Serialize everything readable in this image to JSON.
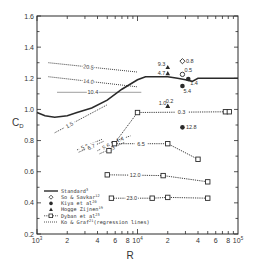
{
  "chart_data": {
    "type": "line",
    "title": "",
    "xlabel": "R",
    "ylabel": "C",
    "ylabel_subscript": "D",
    "xscale": "log",
    "xlim": [
      1000,
      100000
    ],
    "ylim": [
      0.2,
      1.6
    ],
    "y_ticks": [
      0.2,
      0.4,
      0.6,
      0.8,
      1.0,
      1.2,
      1.4,
      1.6
    ],
    "y_tick_labels": [
      "0.2",
      "0.4",
      "0.6",
      "0.8",
      "1.0",
      "1.2",
      "1.4",
      "1.6"
    ],
    "x_major_ticks": [
      1000,
      10000,
      100000
    ],
    "x_tick_labels": [
      {
        "value": 1000,
        "base": "10",
        "exp": "3"
      },
      {
        "value": 2000,
        "base": "2",
        "exp": ""
      },
      {
        "value": 4000,
        "base": "4",
        "exp": ""
      },
      {
        "value": 6000,
        "base": "6",
        "exp": ""
      },
      {
        "value": 8000,
        "base": "8",
        "exp": ""
      },
      {
        "value": 10000,
        "base": "10",
        "exp": "4"
      },
      {
        "value": 20000,
        "base": "2",
        "exp": ""
      },
      {
        "value": 40000,
        "base": "4",
        "exp": ""
      },
      {
        "value": 60000,
        "base": "6",
        "exp": ""
      },
      {
        "value": 80000,
        "base": "8",
        "exp": ""
      },
      {
        "value": 100000,
        "base": "10",
        "exp": "5"
      }
    ],
    "grid": false,
    "legend_position": "bottom-left",
    "legend": [
      {
        "key": "standard",
        "label": "Standard",
        "ref": "3"
      },
      {
        "key": "so_savkar",
        "label": "So & Savkar",
        "ref": "12"
      },
      {
        "key": "kiya",
        "label": "Kiya et al",
        "ref": "20"
      },
      {
        "key": "hogge",
        "label": "Hogge Zijnen",
        "ref": "19"
      },
      {
        "key": "dyban",
        "label": "Dyban et al",
        "ref": "23"
      },
      {
        "key": "ko_graf",
        "label": "Ko & Graf",
        "ref": "21",
        "suffix": "(regression lines)"
      }
    ],
    "series": [
      {
        "name": "Standard",
        "style": "solid",
        "x": [
          1000,
          1200,
          1500,
          2000,
          2500,
          3500,
          5000,
          7000,
          10000,
          12000,
          15000,
          20000,
          25000,
          30000,
          35000,
          40000,
          60000,
          100000
        ],
        "y": [
          0.98,
          0.96,
          0.95,
          0.96,
          0.98,
          1.01,
          1.06,
          1.13,
          1.19,
          1.21,
          1.21,
          1.21,
          1.2,
          1.19,
          1.18,
          1.2,
          1.2,
          1.2
        ]
      },
      {
        "name": "Ko & Graf",
        "style": "dotted-regression",
        "lines": [
          {
            "label": "20.5",
            "x": [
              1300,
              10000
            ],
            "y": [
              1.3,
              1.24
            ],
            "label_at": 0.45
          },
          {
            "label": "14.0",
            "x": [
              1300,
              10000
            ],
            "y": [
              1.21,
              1.145
            ],
            "label_at": 0.45
          },
          {
            "label": "10.4",
            "x": [
              1600,
              11000
            ],
            "y": [
              1.11,
              1.11
            ],
            "label_at": 0.42
          },
          {
            "label": "1.5",
            "x": [
              1500,
              5000
            ],
            "y": [
              0.85,
              1.03
            ],
            "label_at": 0.28
          },
          {
            "label": "5.6",
            "x": [
              2500,
              4500
            ],
            "y": [
              0.74,
              0.81
            ],
            "label_at": 0.3
          },
          {
            "label": "6.7",
            "x": [
              2600,
              4600
            ],
            "y": [
              0.725,
              0.795
            ],
            "label_at": 0.5
          },
          {
            "label": "1.4",
            "x": [
              5000,
              8500
            ],
            "y": [
              0.78,
              0.83
            ],
            "label_at": 0.55
          },
          {
            "label": "5.6",
            "x": [
              4000,
              7000
            ],
            "y": [
              0.735,
              0.815
            ],
            "label_at": 0.35
          },
          {
            "label": "4.3",
            "x": [
              4200,
              7500
            ],
            "y": [
              0.715,
              0.79
            ],
            "label_at": 0.45
          }
        ]
      },
      {
        "name": "Dyban et al",
        "style": "dashed-square",
        "lines": [
          {
            "label": "0.3",
            "x": [
              5200,
              10000,
              75000,
              82000
            ],
            "y": [
              0.735,
              0.98,
              0.985,
              0.985
            ]
          },
          {
            "label": "6.5",
            "x": [
              5900,
              20000,
              40000
            ],
            "y": [
              0.78,
              0.78,
              0.68
            ]
          },
          {
            "label": "12.0",
            "x": [
              5000,
              18000,
              50000
            ],
            "y": [
              0.58,
              0.575,
              0.535
            ]
          },
          {
            "label": "23.0",
            "x": [
              5500,
              14000,
              20000,
              50000
            ],
            "y": [
              0.43,
              0.43,
              0.435,
              0.43
            ]
          }
        ]
      },
      {
        "name": "So & Savkar",
        "style": "marker",
        "points": [
          {
            "label": "0.8",
            "marker": "diamond",
            "x": 28000,
            "y": 1.31
          },
          {
            "label": "0.5",
            "marker": "circle-open",
            "x": 28000,
            "y": 1.225
          }
        ]
      },
      {
        "name": "Kiya et al",
        "style": "marker",
        "points": [
          {
            "label": "1.4",
            "marker": "circle-filled",
            "x": 32000,
            "y": 1.195
          },
          {
            "label": "5.4",
            "marker": "circle-filled",
            "x": 28000,
            "y": 1.15
          },
          {
            "label": "12.8",
            "marker": "circle-filled",
            "x": 28000,
            "y": 0.885
          }
        ]
      },
      {
        "name": "Hogge Zijnen",
        "style": "marker",
        "points": [
          {
            "label": "9.3",
            "marker": "triangle",
            "x": 20000,
            "y": 1.27
          },
          {
            "label": "4.7",
            "marker": "triangle",
            "x": 20000,
            "y": 1.23
          },
          {
            "label": "1.0",
            "marker": "triangle",
            "x": 20000,
            "y": 1.02
          },
          {
            "label": "0.2",
            "marker": "triangle",
            "x": 20000,
            "y": 1.02
          }
        ]
      }
    ]
  }
}
